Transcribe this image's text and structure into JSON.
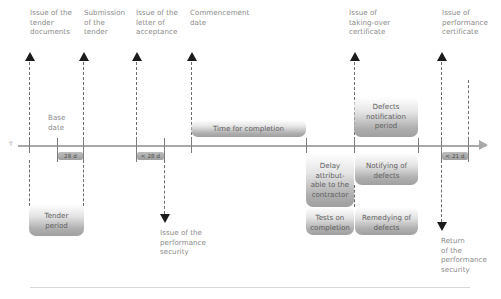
{
  "diagram": {
    "axis_symbol": "T",
    "milestones_above": [
      {
        "id": "issue-tender-documents",
        "label": "Issue of the\ntender\ndocuments"
      },
      {
        "id": "submission-of-tender",
        "label": "Submission\nof the\ntender"
      },
      {
        "id": "issue-letter-acceptance",
        "label": "Issue of the\nletter of\nacceptance"
      },
      {
        "id": "commencement-date",
        "label": "Commencement\ndate"
      },
      {
        "id": "issue-taking-over-certificate",
        "label": "Issue of\ntaking-over\ncertificate"
      },
      {
        "id": "issue-performance-certificate",
        "label": "Issue of\nperformance\ncertificate"
      }
    ],
    "milestones_below": [
      {
        "id": "issue-performance-security",
        "label": "Issue of the\nperformance\nsecurity"
      },
      {
        "id": "return-performance-security",
        "label": "Return\nof the\nperformance\nsecurity"
      }
    ],
    "axis_note": "Base\ndate",
    "durations": [
      {
        "id": "duration-28d",
        "label": "28 d"
      },
      {
        "id": "duration-lt-28d",
        "label": "< 28 d"
      },
      {
        "id": "duration-lt-21d",
        "label": "< 21 d"
      }
    ],
    "bars_above_axis": [
      {
        "id": "time-for-completion",
        "label": "Time for completion"
      },
      {
        "id": "defects-notification-period",
        "label": "Defects\nnotification\nperiod"
      }
    ],
    "bars_below_axis": [
      {
        "id": "delay-attributable-contractor",
        "label": "Delay\nattribut-\nable to the\ncontractor"
      },
      {
        "id": "notifying-of-defects",
        "label": "Notifying of\ndefects"
      },
      {
        "id": "tests-on-completion",
        "label": "Tests on\ncompletion"
      },
      {
        "id": "remedying-of-defects",
        "label": "Remedying of\ndefects"
      },
      {
        "id": "tender-period",
        "label": "Tender\nperiod"
      }
    ],
    "colors": {
      "axis": "#a8a8a8",
      "bar_fill": "#a4a4a4",
      "text": "#8a8a8a",
      "arrow": "#1b1b1b",
      "tick": "#7d7d7d"
    }
  }
}
